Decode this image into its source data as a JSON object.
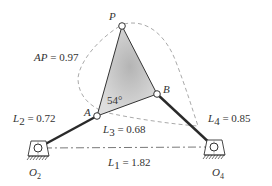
{
  "diagram": {
    "type": "four-bar linkage with coupler curve",
    "colors": {
      "link": "#2a2a2a",
      "coupler_fill_center": "#b8b8b8",
      "coupler_fill_edge": "#dcdcdc",
      "dashed_curve": "#aaaaaa",
      "ground_line": "#555555",
      "text": "#333333"
    },
    "points": {
      "P": {
        "label": "P",
        "x": 122,
        "y": 26
      },
      "A": {
        "label": "A",
        "x": 97,
        "y": 116
      },
      "B": {
        "label": "B",
        "x": 157,
        "y": 94
      },
      "O2": {
        "label": "O",
        "sub": "2",
        "x": 38,
        "y": 148
      },
      "O4": {
        "label": "O",
        "sub": "4",
        "x": 214,
        "y": 147
      }
    },
    "labels": {
      "ap": {
        "lhs": "AP",
        "rhs": " = 0.97"
      },
      "l2": {
        "base": "L",
        "sub": "2",
        "rhs": " = 0.72"
      },
      "l3": {
        "base": "L",
        "sub": "3",
        "rhs": " = 0.68"
      },
      "l4": {
        "base": "L",
        "sub": "4",
        "rhs": " = 0.85"
      },
      "l1": {
        "base": "L",
        "sub": "1",
        "rhs": " = 1.82"
      },
      "angle": "54°"
    }
  }
}
